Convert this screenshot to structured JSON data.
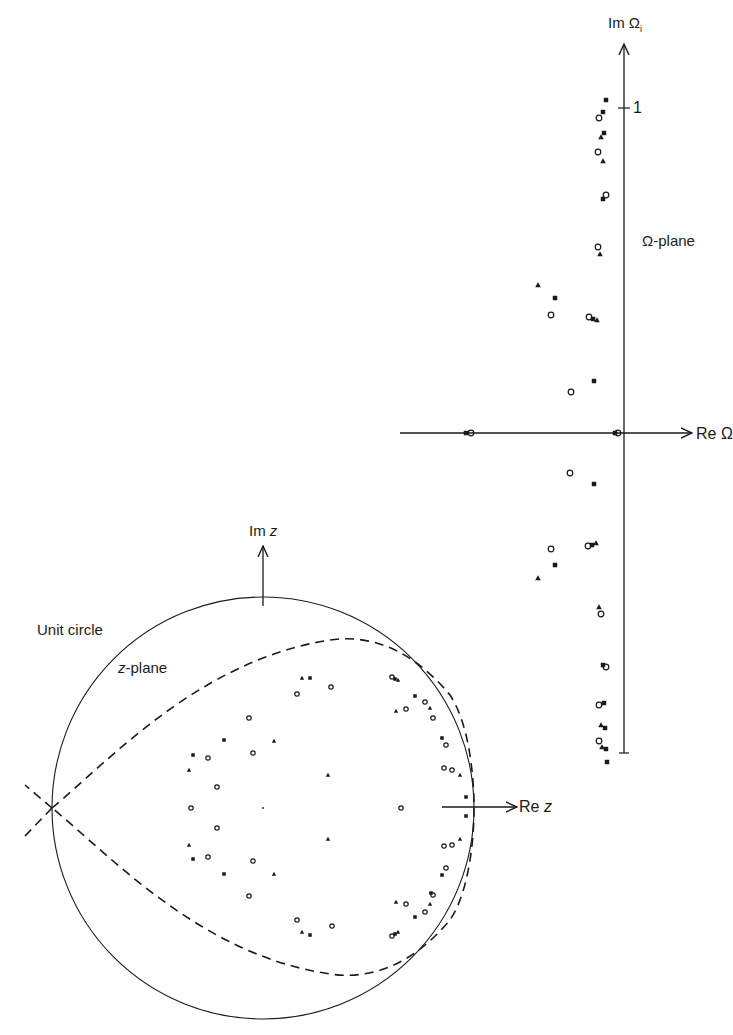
{
  "omega_plane": {
    "title": "Ω-plane",
    "im_axis_label_prefix": "Im",
    "im_axis_label_symbol": "Ω",
    "im_axis_label_sub": "i",
    "re_axis_label_prefix": "Re",
    "re_axis_label_symbol": "Ω",
    "tick_label": "1"
  },
  "z_plane": {
    "title_var": "z",
    "title_suffix": "-plane",
    "unit_circle_label": "Unit circle",
    "im_axis_label_prefix": "Im",
    "im_axis_label_var": "z",
    "re_axis_label_prefix": "Re",
    "re_axis_label_var": "z"
  },
  "colors": {
    "ink": "#1a1a1a",
    "background": "#ffffff"
  },
  "chart_data": [
    {
      "type": "scatter",
      "title": "Ω-plane",
      "xlabel": "Re Ω",
      "ylabel": "Im Ω_i",
      "tick_labels": [
        "1"
      ],
      "markers": [
        "circle (open)",
        "triangle (filled)",
        "square (filled)"
      ],
      "axis_origin_px": [
        623,
        433
      ],
      "unit_px": 325,
      "points_px": [
        {
          "x": 606,
          "y": 100,
          "m": "sq"
        },
        {
          "x": 603,
          "y": 112,
          "m": "sq"
        },
        {
          "x": 599,
          "y": 118,
          "m": "circle"
        },
        {
          "x": 604,
          "y": 133,
          "m": "sq"
        },
        {
          "x": 601,
          "y": 137,
          "m": "tri"
        },
        {
          "x": 598,
          "y": 152,
          "m": "circle"
        },
        {
          "x": 603,
          "y": 161,
          "m": "tri"
        },
        {
          "x": 606,
          "y": 195,
          "m": "circle"
        },
        {
          "x": 603,
          "y": 199,
          "m": "sq"
        },
        {
          "x": 598,
          "y": 247,
          "m": "circle"
        },
        {
          "x": 600,
          "y": 254,
          "m": "tri"
        },
        {
          "x": 538,
          "y": 285,
          "m": "tri"
        },
        {
          "x": 555,
          "y": 298,
          "m": "sq"
        },
        {
          "x": 551,
          "y": 315,
          "m": "circle"
        },
        {
          "x": 589,
          "y": 317,
          "m": "circle"
        },
        {
          "x": 593,
          "y": 319,
          "m": "sq"
        },
        {
          "x": 597,
          "y": 320,
          "m": "tri"
        },
        {
          "x": 594,
          "y": 381,
          "m": "sq"
        },
        {
          "x": 571,
          "y": 392,
          "m": "circle"
        },
        {
          "x": 466,
          "y": 433,
          "m": "sq"
        },
        {
          "x": 471,
          "y": 433,
          "m": "circle"
        },
        {
          "x": 615,
          "y": 433,
          "m": "sq"
        },
        {
          "x": 618,
          "y": 433,
          "m": "circle"
        },
        {
          "x": 570,
          "y": 473,
          "m": "circle"
        },
        {
          "x": 594,
          "y": 484,
          "m": "sq"
        },
        {
          "x": 588,
          "y": 546,
          "m": "circle"
        },
        {
          "x": 592,
          "y": 545,
          "m": "sq"
        },
        {
          "x": 596,
          "y": 543,
          "m": "tri"
        },
        {
          "x": 551,
          "y": 549,
          "m": "circle"
        },
        {
          "x": 555,
          "y": 565,
          "m": "sq"
        },
        {
          "x": 538,
          "y": 578,
          "m": "tri"
        },
        {
          "x": 599,
          "y": 607,
          "m": "tri"
        },
        {
          "x": 601,
          "y": 614,
          "m": "circle"
        },
        {
          "x": 606,
          "y": 667,
          "m": "circle"
        },
        {
          "x": 603,
          "y": 665,
          "m": "sq"
        },
        {
          "x": 599,
          "y": 705,
          "m": "circle"
        },
        {
          "x": 604,
          "y": 703,
          "m": "sq"
        },
        {
          "x": 605,
          "y": 728,
          "m": "sq"
        },
        {
          "x": 601,
          "y": 725,
          "m": "tri"
        },
        {
          "x": 599,
          "y": 741,
          "m": "circle"
        },
        {
          "x": 602,
          "y": 747,
          "m": "tri"
        },
        {
          "x": 606,
          "y": 749,
          "m": "sq"
        },
        {
          "x": 607,
          "y": 762,
          "m": "sq"
        }
      ]
    },
    {
      "type": "scatter",
      "title": "z-plane",
      "xlabel": "Re z",
      "ylabel": "Im z",
      "annotations": [
        "Unit circle",
        "z-plane"
      ],
      "unit_circle_center_px": [
        263,
        808
      ],
      "unit_circle_radius_px": 211,
      "dashed_curve": "cardioid/teardrop contour with cusp at z = -1",
      "points_px": [
        {
          "x": 302,
          "y": 678,
          "m": "tri"
        },
        {
          "x": 310,
          "y": 678,
          "m": "sq"
        },
        {
          "x": 297,
          "y": 694,
          "m": "circle"
        },
        {
          "x": 331,
          "y": 687,
          "m": "circle"
        },
        {
          "x": 392,
          "y": 677,
          "m": "circle"
        },
        {
          "x": 395,
          "y": 679,
          "m": "sq"
        },
        {
          "x": 398,
          "y": 680,
          "m": "tri"
        },
        {
          "x": 415,
          "y": 696,
          "m": "sq"
        },
        {
          "x": 425,
          "y": 702,
          "m": "circle"
        },
        {
          "x": 430,
          "y": 708,
          "m": "tri"
        },
        {
          "x": 396,
          "y": 711,
          "m": "tri"
        },
        {
          "x": 406,
          "y": 709,
          "m": "circle"
        },
        {
          "x": 433,
          "y": 718,
          "m": "circle"
        },
        {
          "x": 442,
          "y": 738,
          "m": "sq"
        },
        {
          "x": 446,
          "y": 745,
          "m": "circle"
        },
        {
          "x": 444,
          "y": 768,
          "m": "circle"
        },
        {
          "x": 452,
          "y": 770,
          "m": "circle"
        },
        {
          "x": 460,
          "y": 775,
          "m": "tri"
        },
        {
          "x": 466,
          "y": 797,
          "m": "sq"
        },
        {
          "x": 466,
          "y": 816,
          "m": "sq"
        },
        {
          "x": 401,
          "y": 808,
          "m": "circle"
        },
        {
          "x": 249,
          "y": 718,
          "m": "circle"
        },
        {
          "x": 224,
          "y": 740,
          "m": "sq"
        },
        {
          "x": 274,
          "y": 741,
          "m": "tri"
        },
        {
          "x": 253,
          "y": 753,
          "m": "circle"
        },
        {
          "x": 193,
          "y": 755,
          "m": "sq"
        },
        {
          "x": 208,
          "y": 758,
          "m": "circle"
        },
        {
          "x": 189,
          "y": 770,
          "m": "tri"
        },
        {
          "x": 328,
          "y": 775,
          "m": "tri"
        },
        {
          "x": 217,
          "y": 787,
          "m": "circle"
        },
        {
          "x": 191,
          "y": 808,
          "m": "circle"
        },
        {
          "x": 263,
          "y": 808,
          "m": "dot"
        },
        {
          "x": 217,
          "y": 828,
          "m": "circle"
        },
        {
          "x": 328,
          "y": 839,
          "m": "tri"
        },
        {
          "x": 189,
          "y": 845,
          "m": "tri"
        },
        {
          "x": 193,
          "y": 859,
          "m": "sq"
        },
        {
          "x": 208,
          "y": 857,
          "m": "circle"
        },
        {
          "x": 253,
          "y": 861,
          "m": "circle"
        },
        {
          "x": 224,
          "y": 874,
          "m": "sq"
        },
        {
          "x": 274,
          "y": 874,
          "m": "tri"
        },
        {
          "x": 249,
          "y": 896,
          "m": "circle"
        },
        {
          "x": 444,
          "y": 846,
          "m": "circle"
        },
        {
          "x": 452,
          "y": 845,
          "m": "circle"
        },
        {
          "x": 460,
          "y": 839,
          "m": "tri"
        },
        {
          "x": 442,
          "y": 875,
          "m": "sq"
        },
        {
          "x": 446,
          "y": 868,
          "m": "circle"
        },
        {
          "x": 433,
          "y": 895,
          "m": "circle"
        },
        {
          "x": 431,
          "y": 893,
          "m": "sq"
        },
        {
          "x": 396,
          "y": 902,
          "m": "tri"
        },
        {
          "x": 406,
          "y": 904,
          "m": "circle"
        },
        {
          "x": 430,
          "y": 904,
          "m": "tri"
        },
        {
          "x": 415,
          "y": 917,
          "m": "sq"
        },
        {
          "x": 425,
          "y": 912,
          "m": "circle"
        },
        {
          "x": 392,
          "y": 936,
          "m": "circle"
        },
        {
          "x": 395,
          "y": 934,
          "m": "sq"
        },
        {
          "x": 398,
          "y": 932,
          "m": "tri"
        },
        {
          "x": 297,
          "y": 920,
          "m": "circle"
        },
        {
          "x": 302,
          "y": 932,
          "m": "tri"
        },
        {
          "x": 310,
          "y": 935,
          "m": "sq"
        },
        {
          "x": 332,
          "y": 926,
          "m": "circle"
        }
      ]
    }
  ]
}
